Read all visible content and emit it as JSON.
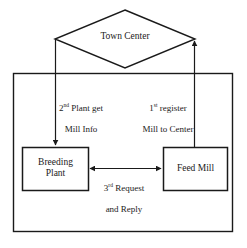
{
  "diagram": {
    "stroke_color": "#1a1a1a",
    "background_color": "#ffffff",
    "nodes": [
      {
        "id": "town-center",
        "shape": "diamond",
        "label": "Town Center"
      },
      {
        "id": "breeding-plant",
        "shape": "rectangle",
        "label": "Breeding\nPlant"
      },
      {
        "id": "feed-mill",
        "shape": "rectangle",
        "label": "Feed Mill"
      }
    ],
    "container": {
      "id": "system-boundary",
      "shape": "rectangle",
      "label": ""
    },
    "edges": [
      {
        "id": "edge-register",
        "from": "feed-mill",
        "to": "town-center",
        "arrow": "single",
        "order": "1",
        "ordinal_suffix": "st",
        "label_line1_rest": " register",
        "label_line2": "Mill to Center"
      },
      {
        "id": "edge-plant-get-info",
        "from": "town-center",
        "to": "breeding-plant",
        "arrow": "single",
        "order": "2",
        "ordinal_suffix": "nd",
        "label_line1_rest": " Plant get",
        "label_line2": "Mill Info"
      },
      {
        "id": "edge-request-reply",
        "from": "breeding-plant",
        "to": "feed-mill",
        "arrow": "double",
        "order": "3",
        "ordinal_suffix": "rd",
        "label_line1_rest": " Request",
        "label_line2": "and Reply"
      }
    ]
  }
}
